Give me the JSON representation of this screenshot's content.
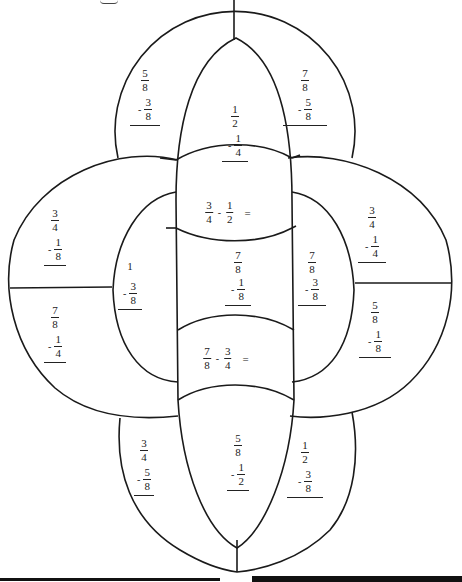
{
  "worksheet": {
    "type": "fraction-subtraction-coloring-diagram",
    "regions": {
      "top_left": {
        "a_num": "5",
        "a_den": "8",
        "b_num": "3",
        "b_den": "8",
        "op": "-"
      },
      "top_center": {
        "a_num": "1",
        "a_den": "2",
        "b_num": "1",
        "b_den": "4",
        "op": "-"
      },
      "top_right": {
        "a_num": "7",
        "a_den": "8",
        "b_num": "5",
        "b_den": "8",
        "op": "-"
      },
      "center_upper": {
        "a_num": "3",
        "a_den": "4",
        "b_num": "1",
        "b_den": "2",
        "op": "-",
        "eq": "="
      },
      "left_upper": {
        "a_num": "3",
        "a_den": "4",
        "b_num": "1",
        "b_den": "8",
        "op": "-"
      },
      "left_inner": {
        "whole": "1",
        "b_num": "3",
        "b_den": "8",
        "op": "-"
      },
      "left_lower": {
        "a_num": "7",
        "a_den": "8",
        "b_num": "1",
        "b_den": "4",
        "op": "-"
      },
      "center_middle": {
        "a_num": "7",
        "a_den": "8",
        "b_num": "1",
        "b_den": "8",
        "op": "-"
      },
      "right_inner": {
        "a_num": "7",
        "a_den": "8",
        "b_num": "3",
        "b_den": "8",
        "op": "-"
      },
      "right_upper": {
        "a_num": "3",
        "a_den": "4",
        "b_num": "1",
        "b_den": "4",
        "op": "-"
      },
      "right_lower": {
        "a_num": "5",
        "a_den": "8",
        "b_num": "1",
        "b_den": "8",
        "op": "-"
      },
      "center_lower": {
        "a_num": "7",
        "a_den": "8",
        "b_num": "3",
        "b_den": "4",
        "op": "-",
        "eq": "="
      },
      "bottom_left": {
        "a_num": "3",
        "a_den": "4",
        "b_num": "5",
        "b_den": "8",
        "op": "-"
      },
      "bottom_center": {
        "a_num": "5",
        "a_den": "8",
        "b_num": "1",
        "b_den": "2",
        "op": "-"
      },
      "bottom_right": {
        "a_num": "1",
        "a_den": "2",
        "b_num": "3",
        "b_den": "8",
        "op": "-"
      }
    },
    "colors": {
      "line": "#1a1a1a",
      "background": "#ffffff",
      "bar": "#111111"
    }
  }
}
